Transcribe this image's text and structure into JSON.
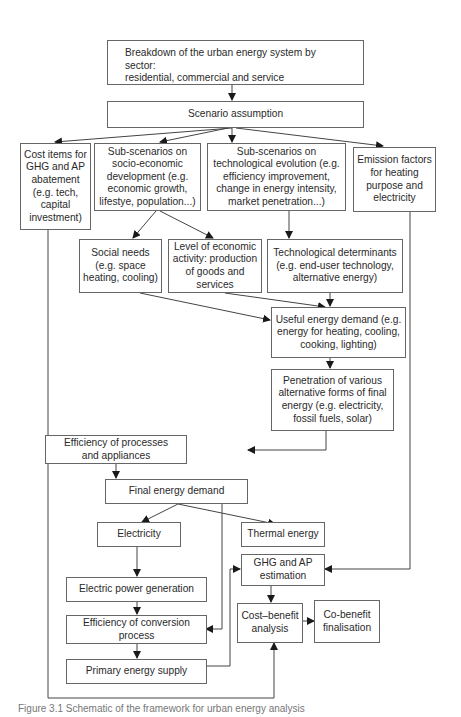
{
  "diagram": {
    "nodes": {
      "breakdown": "Breakdown of the urban energy system by sector:\nresidential, commercial and service",
      "scenario": "Scenario assumption",
      "cost_items": "Cost items for\nGHG and AP\nabatement\n(e.g. tech,\ncapital\ninvestment)",
      "socio_econ": "Sub-scenarios on\nsocio-economic\ndevelopment (e.g.\neconomic growth,\nlifestye, population...)",
      "tech_evo": "Sub-scenarios on\ntechnological evolution (e.g.\nefficiency improvement,\nchange in energy intensity,\nmarket penetration...)",
      "emission": "Emission factors\nfor heating\npurpose and\nelectricity",
      "social_needs": "Social needs\n(e.g. space\nheating, cooling)",
      "econ_activity": "Level of economic\nactivity: production\nof goods and\nservices",
      "tech_determinants": "Technological determinants\n(e.g. end-user technology,\nalternative energy)",
      "useful_energy": "Useful energy demand (e.g.\nenergy for heating, cooling,\ncooking, lighting)",
      "penetration": "Penetration of various\nalternative forms of final\nenergy (e.g. electricity,\nfossil fuels, solar)",
      "efficiency_processes": "Efficiency of processes\nand appliances",
      "final_demand": "Final energy demand",
      "electricity": "Electricity",
      "thermal": "Thermal energy",
      "ghg_estimation": "GHG and AP\nestimation",
      "power_gen": "Electric power generation",
      "conversion_eff": "Efficiency of conversion\nprocess",
      "cost_benefit": "Cost–benefit\nanalysis",
      "co_benefit": "Co-benefit\nfinalisation",
      "primary_supply": "Primary energy supply"
    },
    "edges": [
      [
        "breakdown",
        "scenario"
      ],
      [
        "scenario",
        "cost_items"
      ],
      [
        "scenario",
        "socio_econ"
      ],
      [
        "scenario",
        "tech_evo"
      ],
      [
        "scenario",
        "emission"
      ],
      [
        "socio_econ",
        "social_needs"
      ],
      [
        "socio_econ",
        "econ_activity"
      ],
      [
        "tech_evo",
        "tech_determinants"
      ],
      [
        "social_needs",
        "useful_energy"
      ],
      [
        "econ_activity",
        "useful_energy"
      ],
      [
        "tech_determinants",
        "useful_energy"
      ],
      [
        "useful_energy",
        "penetration"
      ],
      [
        "penetration",
        "efficiency_processes"
      ],
      [
        "efficiency_processes",
        "final_demand"
      ],
      [
        "final_demand",
        "electricity"
      ],
      [
        "final_demand",
        "thermal"
      ],
      [
        "final_demand",
        "conversion_eff"
      ],
      [
        "electricity",
        "power_gen"
      ],
      [
        "power_gen",
        "conversion_eff"
      ],
      [
        "conversion_eff",
        "primary_supply"
      ],
      [
        "primary_supply",
        "ghg_estimation"
      ],
      [
        "emission",
        "ghg_estimation"
      ],
      [
        "ghg_estimation",
        "cost_benefit"
      ],
      [
        "cost_benefit",
        "co_benefit"
      ],
      [
        "cost_items",
        "cost_benefit"
      ]
    ],
    "caption": "Figure 3.1  Schematic of the framework for urban energy analysis"
  }
}
